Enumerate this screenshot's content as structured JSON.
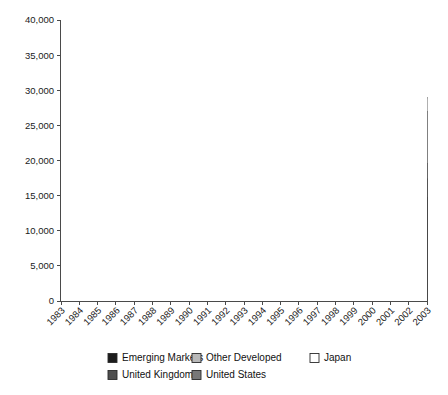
{
  "chart_data": {
    "type": "area",
    "stacked": true,
    "title": "",
    "xlabel": "",
    "ylabel": "",
    "grid": true,
    "legend_position": "bottom",
    "ylim": [
      0,
      40000
    ],
    "ytick_step": 5000,
    "yticks": [
      "0",
      "5,000",
      "10,000",
      "15,000",
      "20,000",
      "25,000",
      "30,000",
      "35,000",
      "40,000"
    ],
    "categories": [
      "1983",
      "1984",
      "1985",
      "1986",
      "1987",
      "1988",
      "1989",
      "1990",
      "1991",
      "1992",
      "1993",
      "1994",
      "1995",
      "1996",
      "1997",
      "1998",
      "1999",
      "2000",
      "2001",
      "2002",
      "2003"
    ],
    "series": [
      {
        "name": "United States",
        "color": "#787878",
        "values": [
          2000,
          2050,
          2320,
          2560,
          2700,
          2830,
          3100,
          3080,
          3720,
          4030,
          4550,
          4500,
          5800,
          7000,
          8900,
          10900,
          14000,
          19500,
          16500,
          12000,
          14800
        ]
      },
      {
        "name": "United Kingdom",
        "color": "#4e4e4e",
        "values": [
          350,
          320,
          380,
          470,
          580,
          620,
          1150,
          830,
          1030,
          900,
          1250,
          1300,
          1350,
          1450,
          1700,
          2050,
          2400,
          2900,
          2600,
          2150,
          2600
        ]
      },
      {
        "name": "Japan",
        "color": "#ffffff",
        "values": [
          420,
          460,
          800,
          1250,
          1850,
          2600,
          3650,
          2800,
          3450,
          2500,
          2700,
          2800,
          2650,
          2700,
          2300,
          2100,
          3300,
          2400,
          2100,
          1900,
          2200
        ]
      },
      {
        "name": "Other Developed",
        "color": "#b8b8b8",
        "values": [
          480,
          520,
          800,
          1300,
          1600,
          2000,
          2600,
          2100,
          2550,
          2400,
          3000,
          3300,
          3300,
          3500,
          3900,
          4400,
          5300,
          8200,
          3800,
          3900,
          7400
        ]
      },
      {
        "name": "Emerging Markets",
        "color": "#1c1c1c",
        "values": [
          150,
          150,
          200,
          320,
          420,
          550,
          1300,
          490,
          750,
          670,
          1200,
          1400,
          1100,
          1150,
          1300,
          950,
          1500,
          2000,
          1000,
          1050,
          2000
        ]
      }
    ],
    "stack_order_bottom_to_top": [
      "United States",
      "United Kingdom",
      "Japan",
      "Other Developed",
      "Emerging Markets"
    ],
    "totals": [
      3400,
      3500,
      4500,
      5900,
      7150,
      8600,
      11800,
      9300,
      11500,
      10500,
      12700,
      13300,
      14200,
      15800,
      18100,
      20400,
      26500,
      35000,
      26000,
      21000,
      29000
    ]
  },
  "legend": {
    "items": [
      {
        "label": "Emerging Markets",
        "color": "#1c1c1c"
      },
      {
        "label": "Other Developed",
        "color": "#b8b8b8"
      },
      {
        "label": "Japan",
        "color": "#ffffff"
      },
      {
        "label": "United Kingdom",
        "color": "#4e4e4e"
      },
      {
        "label": "United States",
        "color": "#787878"
      }
    ]
  }
}
